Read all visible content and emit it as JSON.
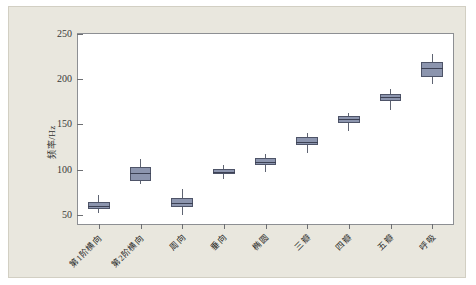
{
  "chart_data": {
    "type": "box",
    "title": "",
    "xlabel": "",
    "ylabel": "频率/Hz",
    "ylim": [
      40,
      250
    ],
    "yticks": [
      50,
      100,
      150,
      200,
      250
    ],
    "grid": false,
    "legend": "none",
    "categories": [
      "第1阶横向",
      "第2阶横向",
      "周向",
      "垂向",
      "椭圆",
      "三瓣",
      "四瓣",
      "五瓣",
      "呼吸"
    ],
    "boxes": [
      {
        "label": "第1阶横向",
        "min": 52,
        "q1": 57,
        "median": 60,
        "q3": 64,
        "max": 72
      },
      {
        "label": "第2阶横向",
        "min": 84,
        "q1": 88,
        "median": 96,
        "q3": 103,
        "max": 112
      },
      {
        "label": "周向",
        "min": 50,
        "q1": 59,
        "median": 63,
        "q3": 69,
        "max": 79
      },
      {
        "label": "垂向",
        "min": 90,
        "q1": 95,
        "median": 98,
        "q3": 101,
        "max": 105
      },
      {
        "label": "椭圆",
        "min": 98,
        "q1": 105,
        "median": 109,
        "q3": 113,
        "max": 117
      },
      {
        "label": "三瓣",
        "min": 119,
        "q1": 127,
        "median": 131,
        "q3": 136,
        "max": 141
      },
      {
        "label": "四瓣",
        "min": 143,
        "q1": 152,
        "median": 156,
        "q3": 159,
        "max": 163
      },
      {
        "label": "五瓣",
        "min": 166,
        "q1": 176,
        "median": 180,
        "q3": 184,
        "max": 189
      },
      {
        "label": "呼吸",
        "min": 195,
        "q1": 203,
        "median": 212,
        "q3": 219,
        "max": 228
      }
    ],
    "colors": {
      "box_fill": "#8c95ae",
      "box_edge": "#4e5468",
      "median": "#3c4154",
      "whisker": "#5f6472",
      "axis": "#8d8f93",
      "plot_background": "#ffffff",
      "figure_background": "#e9e7de"
    }
  }
}
